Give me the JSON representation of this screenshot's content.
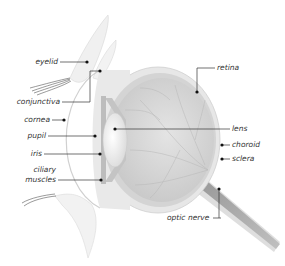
{
  "diagram": {
    "labels_left": [
      {
        "id": "eyelid",
        "text": "eyelid"
      },
      {
        "id": "conjunctiva",
        "text": "conjunctiva"
      },
      {
        "id": "cornea",
        "text": "cornea"
      },
      {
        "id": "pupil",
        "text": "pupil"
      },
      {
        "id": "iris",
        "text": "iris"
      },
      {
        "id": "ciliary-muscles-1",
        "text": "ciliary"
      },
      {
        "id": "ciliary-muscles-2",
        "text": "muscles"
      }
    ],
    "labels_right": [
      {
        "id": "retina",
        "text": "retina"
      },
      {
        "id": "lens",
        "text": "lens"
      },
      {
        "id": "choroid",
        "text": "choroid"
      },
      {
        "id": "sclera",
        "text": "sclera"
      },
      {
        "id": "optic-nerve",
        "text": "optic nerve"
      }
    ],
    "colors": {
      "background": "#ffffff",
      "sclera": "#e6e6e6",
      "choroid": "#cfcfcf",
      "retina_interior": "#d8d8d8",
      "lens": "#f7f7f7",
      "leader_line": "#333333",
      "label_text": "#333333"
    }
  }
}
